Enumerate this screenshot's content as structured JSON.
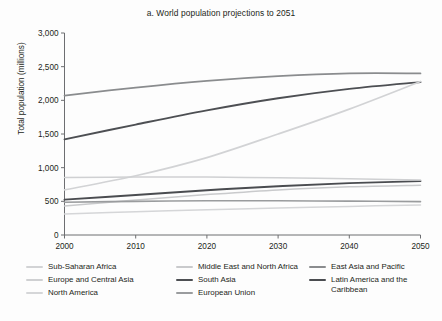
{
  "chart_data": {
    "type": "line",
    "title": "a. World population projections to 2051",
    "xlabel": "",
    "ylabel": "Total population (millions)",
    "xlim": [
      2000,
      2050
    ],
    "ylim": [
      0,
      3000
    ],
    "xticks": [
      "2000",
      "2010",
      "2020",
      "2030",
      "2040",
      "2050"
    ],
    "yticks": [
      "0",
      "500",
      "1,000",
      "1,500",
      "2,000",
      "2,500",
      "3,000"
    ],
    "grid": false,
    "legend_position": "bottom",
    "x": [
      2000,
      2010,
      2020,
      2030,
      2040,
      2050
    ],
    "series": [
      {
        "name": "East Asia and Pacific",
        "color": "#8a8c8e",
        "width": 1.7,
        "values": [
          2070,
          2190,
          2290,
          2360,
          2400,
          2400
        ]
      },
      {
        "name": "South Asia",
        "color": "#4d4f53",
        "width": 1.9,
        "values": [
          1420,
          1640,
          1850,
          2030,
          2170,
          2270
        ]
      },
      {
        "name": "Sub-Saharan Africa",
        "color": "#d2d3d5",
        "width": 1.7,
        "values": [
          670,
          880,
          1150,
          1500,
          1870,
          2280
        ]
      },
      {
        "name": "Latin America and the Caribbean",
        "color": "#4a4c50",
        "width": 1.9,
        "values": [
          525,
          595,
          665,
          725,
          770,
          800
        ]
      },
      {
        "name": "Middle East and North Africa",
        "color": "#c9cacc",
        "width": 1.5,
        "values": [
          430,
          520,
          600,
          670,
          715,
          740
        ]
      },
      {
        "name": "Europe and Central Asia",
        "color": "#cfd0d2",
        "width": 1.5,
        "values": [
          855,
          860,
          860,
          850,
          835,
          815
        ]
      },
      {
        "name": "European Union",
        "color": "#9a9c9e",
        "width": 1.6,
        "values": [
          487,
          500,
          508,
          508,
          503,
          495
        ]
      },
      {
        "name": "North America",
        "color": "#d5d6d8",
        "width": 1.5,
        "values": [
          313,
          345,
          375,
          402,
          425,
          445
        ]
      }
    ]
  },
  "legend": {
    "columns": [
      {
        "items": [
          {
            "label": "Sub-Saharan Africa",
            "color": "#d2d3d5"
          },
          {
            "label": "Europe and Central Asia",
            "color": "#cfd0d2"
          },
          {
            "label": "North America",
            "color": "#d5d6d8"
          }
        ]
      },
      {
        "items": [
          {
            "label": "Middle East and North Africa",
            "color": "#c9cacc"
          },
          {
            "label": "South Asia",
            "color": "#4d4f53"
          },
          {
            "label": "European Union",
            "color": "#9a9c9e"
          }
        ]
      },
      {
        "items": [
          {
            "label": "East Asia and Pacific",
            "color": "#8a8c8e"
          },
          {
            "label": "Latin America and the Caribbean",
            "color": "#4a4c50"
          }
        ]
      }
    ]
  }
}
